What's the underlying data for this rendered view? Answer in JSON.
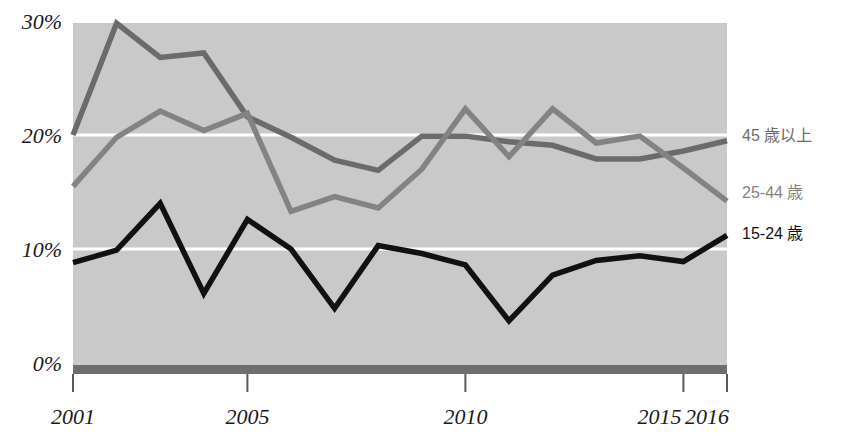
{
  "chart_data": {
    "type": "line",
    "title": "",
    "xlabel": "",
    "ylabel": "",
    "x": [
      2001,
      2002,
      2003,
      2004,
      2005,
      2006,
      2007,
      2008,
      2009,
      2010,
      2011,
      2012,
      2013,
      2014,
      2015,
      2016
    ],
    "xlim": [
      2001,
      2016
    ],
    "ylim": [
      0,
      31
    ],
    "xticks": [
      "2001",
      "2005",
      "2010",
      "2015",
      "2016"
    ],
    "xtick_values": [
      2001,
      2005,
      2010,
      2015,
      2016
    ],
    "yticks": [
      "0%",
      "10%",
      "20%",
      "30%"
    ],
    "ytick_values": [
      0,
      10,
      20,
      30
    ],
    "gridlines": {
      "y": [
        10,
        20
      ],
      "color": "#ffffff",
      "x": false
    },
    "plot_bgcolor": "#c9c9c9",
    "legend_position": "right-outside",
    "series": [
      {
        "name": "45 歳以上",
        "color": "#6b6b6b",
        "label_y": 20.0,
        "values": [
          20.0,
          29.8,
          26.8,
          27.2,
          21.6,
          19.8,
          17.8,
          16.9,
          19.9,
          19.9,
          19.4,
          19.1,
          17.9,
          17.9,
          18.6,
          19.5
        ]
      },
      {
        "name": "25-44 歳",
        "color": "#838383",
        "label_y": 15.0,
        "values": [
          15.5,
          19.8,
          22.1,
          20.4,
          21.9,
          13.3,
          14.6,
          13.6,
          17.0,
          22.3,
          18.1,
          22.3,
          19.3,
          19.9,
          17.1,
          14.2
        ]
      },
      {
        "name": "15-24 歳",
        "color": "#111111",
        "label_y": 11.4,
        "values": [
          8.8,
          9.9,
          14.0,
          6.1,
          12.6,
          10.0,
          4.8,
          10.3,
          9.6,
          8.6,
          3.7,
          7.7,
          9.0,
          9.4,
          8.9,
          11.2
        ]
      }
    ]
  },
  "axis": {
    "baseline_color": "#6e6e6e",
    "tick_color": "#5a5a5a"
  }
}
